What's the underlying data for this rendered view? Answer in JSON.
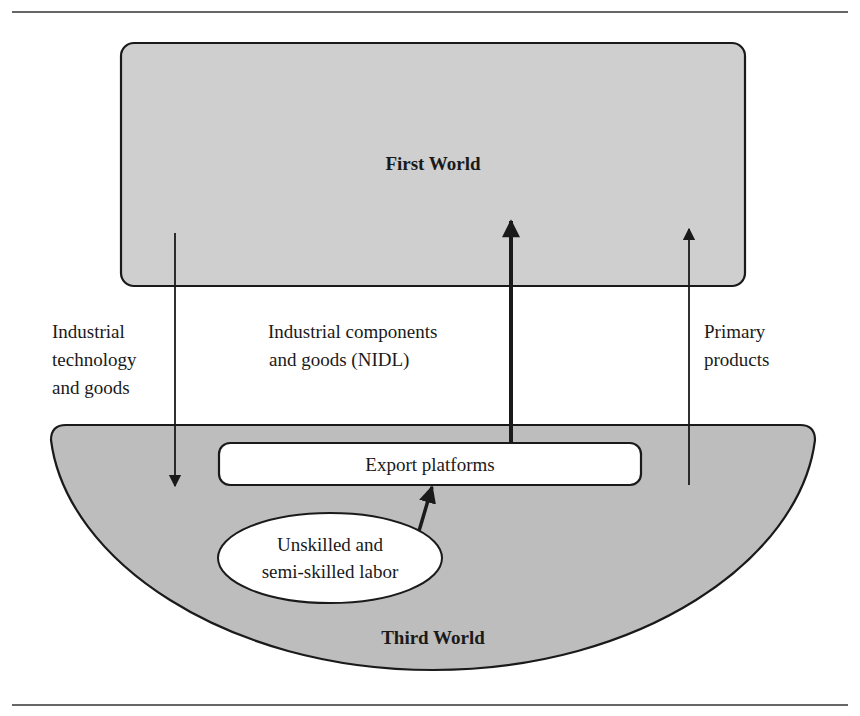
{
  "diagram": {
    "nodes": {
      "first_world": {
        "label": "First World"
      },
      "third_world": {
        "label": "Third World"
      },
      "export_platforms": {
        "label": "Export platforms"
      },
      "labor": {
        "label_lines": [
          "Unskilled and",
          "semi-skilled labor"
        ]
      }
    },
    "flows": {
      "industrial_technology": {
        "label_lines": [
          "Industrial",
          "technology",
          "and goods"
        ],
        "direction": "First World → Third World"
      },
      "industrial_components": {
        "label_lines": [
          "Industrial components",
          "and goods (NIDL)"
        ],
        "direction": "Export platforms → First World",
        "emphasis": "thick"
      },
      "primary_products": {
        "label_lines": [
          "Primary",
          "products"
        ],
        "direction": "Third World → First World"
      },
      "labor_to_platforms": {
        "direction": "Unskilled and semi-skilled labor → Export platforms",
        "emphasis": "thick"
      }
    },
    "colors": {
      "first_world_fill": "#cfcfcf",
      "third_world_fill": "#bdbdbd",
      "stroke": "#1a1a1a",
      "box_fill": "#ffffff"
    }
  }
}
